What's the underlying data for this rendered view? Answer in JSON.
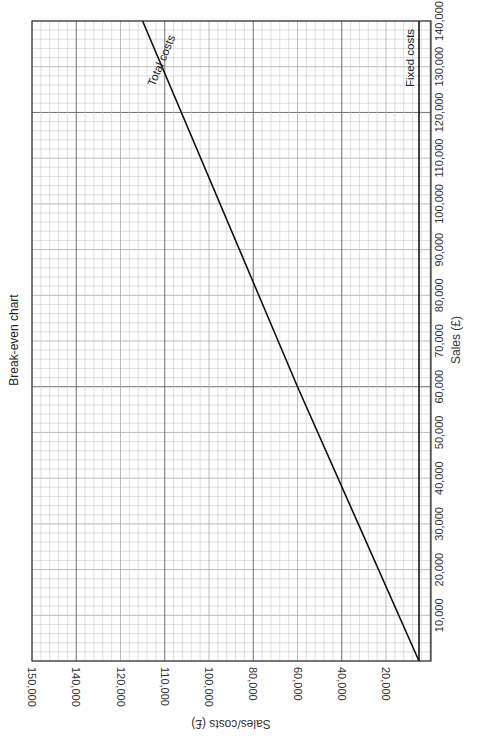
{
  "chart_data": {
    "type": "line",
    "orientation": "rotated 90deg clockwise on page",
    "title": "Break-even chart",
    "xlabel": "Sales (£)",
    "ylabel": "Sales/costs (£)",
    "x_ticks": [
      "10,000",
      "20,000",
      "30,000",
      "40,000",
      "50,000",
      "60,000",
      "70,000",
      "80,000",
      "90,000",
      "100,000",
      "110,000",
      "120,000",
      "130,000",
      "140,000"
    ],
    "y_ticks": [
      "20,000",
      "40,000",
      "60,000",
      "80,000",
      "100,000",
      "110,000",
      "120,000",
      "140,000",
      "150,000"
    ],
    "xlim": [
      0,
      140000
    ],
    "ylim": [
      0,
      150000
    ],
    "grid": true,
    "series": [
      {
        "name": "Total costs",
        "x": [
          0,
          60000,
          140000
        ],
        "y": [
          5000,
          60000,
          115000
        ]
      },
      {
        "name": "Fixed costs",
        "x": [
          0,
          140000
        ],
        "y": [
          5000,
          5000
        ]
      }
    ],
    "annotations": [
      "Total costs",
      "Fixed costs"
    ],
    "legend": "none (lines labelled directly)"
  },
  "labels": {
    "title": "Break-even chart",
    "xlabel": "Sales (£)",
    "ylabel": "Sales/costs (£)",
    "total_costs": "Total costs",
    "fixed_costs": "Fixed costs"
  }
}
